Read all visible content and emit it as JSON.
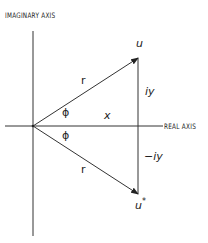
{
  "diagram": {
    "colors": {
      "line": "#333333",
      "text": "#222222",
      "background": "#ffffff"
    },
    "axes": {
      "imaginary_label": "IMAGINARY AXIS",
      "real_label": "REAL AXIS"
    },
    "points": {
      "u": {
        "label": "u"
      },
      "u_conj": {
        "label": "u",
        "superscript": "*"
      }
    },
    "labels": {
      "r_upper": "r",
      "r_lower": "r",
      "phi_upper": "ϕ",
      "phi_lower": "ϕ",
      "x": "x",
      "iy": "iy",
      "minus_iy": "−iy"
    }
  }
}
